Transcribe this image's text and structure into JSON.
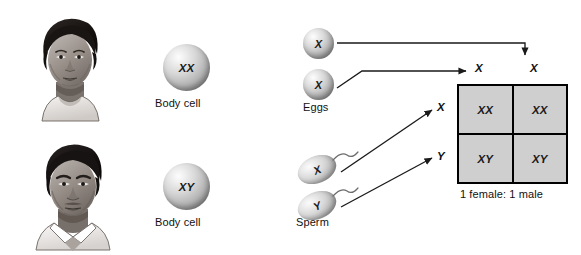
{
  "parents": [
    {
      "sex": "female",
      "portrait_name": "female-portrait",
      "body_cell_genotype": "XX",
      "body_cell_label": "Body cell"
    },
    {
      "sex": "male",
      "portrait_name": "male-portrait",
      "body_cell_genotype": "XY",
      "body_cell_label": "Body cell"
    }
  ],
  "gametes": {
    "eggs": {
      "label": "Eggs",
      "cells": [
        "X",
        "X"
      ]
    },
    "sperm": {
      "label": "Sperm",
      "cells": [
        "X",
        "Y"
      ]
    }
  },
  "punnett": {
    "column_headers": [
      "X",
      "X"
    ],
    "row_headers": [
      "X",
      "Y"
    ],
    "cells": [
      [
        "XX",
        "XX"
      ],
      [
        "XY",
        "XY"
      ]
    ],
    "ratio_caption": "1 female: 1 male"
  },
  "colors": {
    "background": "#ffffff",
    "cell_fill": "#cfcfcf",
    "line": "#1a1a1a",
    "text": "#111111"
  }
}
